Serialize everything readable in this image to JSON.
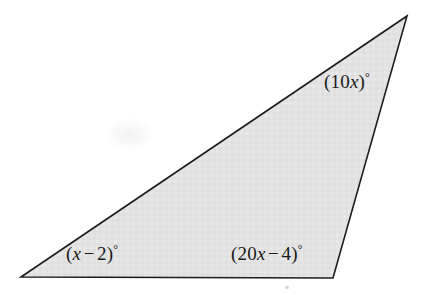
{
  "figure": {
    "name": "triangle-with-algebraic-angle-labels",
    "background_color": "#ffffff",
    "fill_color": "#e3e3e3",
    "stroke_color": "#1c1c1c",
    "stroke_width": 1.6
  },
  "geometry": {
    "shape": "triangle",
    "vertices": [
      {
        "name": "bottom-left",
        "x": 21,
        "y": 277
      },
      {
        "name": "apex-top-right",
        "x": 407,
        "y": 16
      },
      {
        "name": "bottom-right",
        "x": 333,
        "y": 278
      }
    ],
    "polygon_points": "21,277 407,16 333,278"
  },
  "labels": {
    "top_right": {
      "id": "angle-10x",
      "full_text": "(10x)°",
      "open_paren": "(",
      "coefficient": "10",
      "variable": "x",
      "close_paren": ")",
      "degree_symbol": "°",
      "at_vertex": "apex-top-right"
    },
    "bottom_left": {
      "id": "angle-x-minus-2",
      "full_text": "(x − 2)°",
      "open_paren": "(",
      "variable": "x",
      "operator": "−",
      "constant": "2",
      "close_paren": ")",
      "degree_symbol": "°",
      "at_vertex": "bottom-left"
    },
    "bottom_right": {
      "id": "angle-20x-minus-4",
      "full_text": "(20x − 4)°",
      "open_paren": "(",
      "coefficient": "20",
      "variable": "x",
      "operator": "−",
      "constant": "4",
      "close_paren": ")",
      "degree_symbol": "°",
      "at_vertex": "bottom-right"
    }
  }
}
